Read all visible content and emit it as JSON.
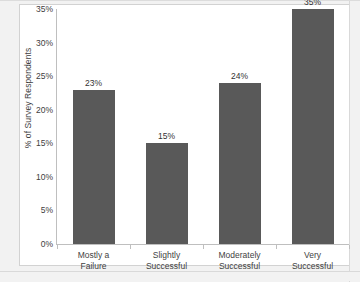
{
  "chart_data": {
    "type": "bar",
    "title": "",
    "xlabel": "",
    "ylabel": "% of Survey Respondents",
    "categories": [
      "Mostly a Failure",
      "Slightly Successful",
      "Moderately Successful",
      "Very Successful"
    ],
    "category_lines": [
      [
        "Mostly a",
        "Failure"
      ],
      [
        "Slightly",
        "Successful"
      ],
      [
        "Moderately",
        "Successful"
      ],
      [
        "Very",
        "Successful"
      ]
    ],
    "values": [
      23,
      15,
      24,
      35
    ],
    "value_labels": [
      "23%",
      "15%",
      "24%",
      "35%"
    ],
    "ylim": [
      0,
      35
    ],
    "ytick_values": [
      0,
      5,
      10,
      15,
      20,
      25,
      30,
      35
    ],
    "ytick_labels": [
      "0%",
      "5%",
      "10%",
      "15%",
      "20%",
      "25%",
      "30%",
      "35%"
    ],
    "grid": false,
    "legend": false,
    "bar_color": "#595959",
    "plot_background": "#ffffff",
    "figure_background": "#f2f2f2",
    "axis_color": "#bfbfbf",
    "text_color": "#3f3f3f"
  }
}
